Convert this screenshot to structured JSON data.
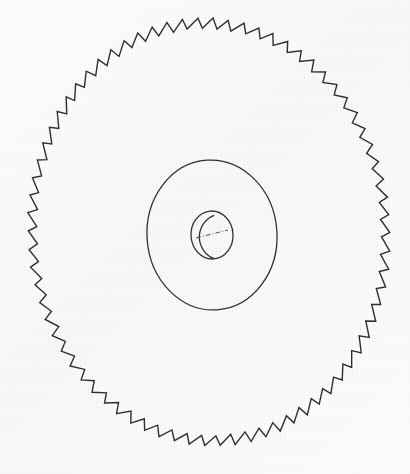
{
  "document": {
    "kind": "technical-line-drawing",
    "subject": "circular saw blade",
    "view": "isometric perspective",
    "background_color": "#fbfbfb",
    "ink_color": "#2b2b2b",
    "title": "Circular Saw Blade"
  },
  "drawing": {
    "canvas": {
      "width": 410,
      "height": 474
    },
    "blade": {
      "label": "saw blade body",
      "center_x": 209,
      "center_y": 232,
      "radius_x": 181,
      "radius_y": 214,
      "rotation_deg": -4,
      "stroke_color": "#2e2e2e",
      "stroke_width": 1.4
    },
    "teeth": {
      "label": "saw teeth",
      "count": 74,
      "profile": "sawtooth",
      "tip_radius_ratio": 1.0,
      "root_radius_ratio": 0.952,
      "rake_fraction": 0.74,
      "stroke_color": "#2e2e2e",
      "stroke_width": 1.4
    },
    "hub": {
      "label": "hub flange",
      "center_x": 212,
      "center_y": 235,
      "radius_x": 65,
      "radius_y": 75,
      "rotation_deg": -4,
      "stroke_color": "#303030",
      "stroke_width": 1.3
    },
    "bore": {
      "label": "arbor bore",
      "center_x": 212,
      "center_y": 235,
      "radius_x": 21,
      "radius_y": 24,
      "rotation_deg": -4,
      "stroke_color": "#303030",
      "stroke_width": 1.3,
      "wall_offset_x": -4,
      "wall_offset_y": 2
    },
    "keyway": {
      "label": "bore centerline",
      "x1": 196,
      "y1": 238,
      "x2": 228,
      "y2": 230,
      "stroke_color": "#3a3a3a",
      "stroke_width": 0.9,
      "dash": "5 2 1 2"
    }
  }
}
